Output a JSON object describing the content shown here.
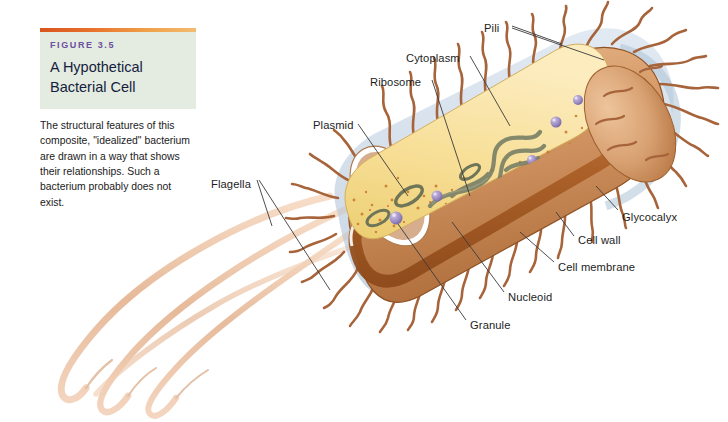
{
  "figure": {
    "number": "FIGURE 3.5",
    "title": "A Hypothetical\nBacterial Cell",
    "title_line1": "A Hypothetical",
    "title_line2": "Bacterial Cell",
    "caption": "The structural features of this composite, \"idealized\" bacterium are drawn in a way that shows their relationships. Such a bacterium probably does not exist.",
    "accent_bar_color": "#d9541e",
    "header_bg_color": "#e4ece1",
    "figure_number_color": "#6b4fa0",
    "title_color": "#14213d"
  },
  "labels": [
    {
      "id": "pili",
      "text": "Pili",
      "x": 484,
      "y": 22
    },
    {
      "id": "cytoplasm",
      "text": "Cytoplasm",
      "x": 410,
      "y": 52
    },
    {
      "id": "ribosome",
      "text": "Ribosome",
      "x": 374,
      "y": 76
    },
    {
      "id": "plasmid",
      "text": "Plasmid",
      "x": 317,
      "y": 120
    },
    {
      "id": "flagella",
      "text": "Flagella",
      "x": 213,
      "y": 178
    },
    {
      "id": "glycocalyx",
      "text": "Glycocalyx",
      "x": 622,
      "y": 212
    },
    {
      "id": "cell-wall",
      "text": "Cell wall",
      "x": 578,
      "y": 235
    },
    {
      "id": "cell-membrane",
      "text": "Cell membrane",
      "x": 558,
      "y": 262
    },
    {
      "id": "nucleoid",
      "text": "Nucleoid",
      "x": 508,
      "y": 292
    },
    {
      "id": "granule",
      "text": "Granule",
      "x": 470,
      "y": 320
    }
  ],
  "colors": {
    "cytoplasm": "#f6dc92",
    "cytoplasm_light": "#fbe9b4",
    "cell_wall": "#b5692f",
    "cell_wall_light": "#d9935c",
    "cell_surface": "#d59a6a",
    "glycocalyx": "#b9cbdd",
    "membrane": "#ffffff",
    "nucleoid": "#7c8268",
    "granule": "#9a8cc0",
    "pili": "#a7643a",
    "flagella": "#f0c3a3",
    "leader_line": "#3a3a3a"
  },
  "structures": {
    "pili_count": 34,
    "flagella_count": 3,
    "granule_count": 7,
    "ribosome_dot_count": 120
  }
}
